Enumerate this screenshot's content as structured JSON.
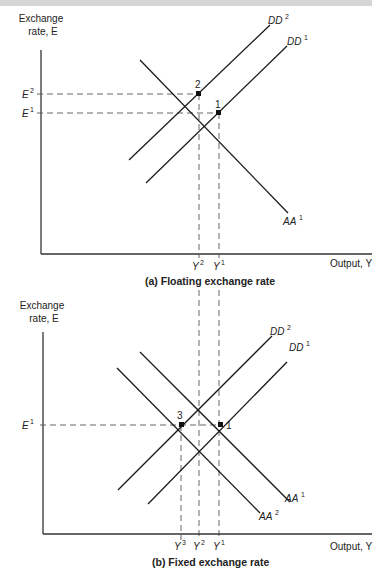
{
  "panels": [
    {
      "id": "a",
      "caption": "(a) Floating exchange rate",
      "y_axis_label_line1": "Exchange",
      "y_axis_label_line2": "rate, E",
      "x_axis_label": "Output, Y",
      "y_ticks": [
        {
          "label": "E",
          "sup": "2"
        },
        {
          "label": "E",
          "sup": "1"
        }
      ],
      "x_ticks": [
        {
          "label": "Y",
          "sup": "2"
        },
        {
          "label": "Y",
          "sup": "1"
        }
      ],
      "curves": [
        {
          "name": "DD",
          "sup": "2"
        },
        {
          "name": "DD",
          "sup": "1"
        },
        {
          "name": "AA",
          "sup": "1"
        }
      ],
      "points": [
        "2",
        "1"
      ]
    },
    {
      "id": "b",
      "caption": "(b) Fixed exchange rate",
      "y_axis_label_line1": "Exchange",
      "y_axis_label_line2": "rate, E",
      "x_axis_label": "Output, Y",
      "y_ticks": [
        {
          "label": "E",
          "sup": "1"
        }
      ],
      "x_ticks": [
        {
          "label": "Y",
          "sup": "3"
        },
        {
          "label": "Y",
          "sup": "2"
        },
        {
          "label": "Y",
          "sup": "1"
        }
      ],
      "curves": [
        {
          "name": "DD",
          "sup": "2"
        },
        {
          "name": "DD",
          "sup": "1"
        },
        {
          "name": "AA",
          "sup": "1"
        },
        {
          "name": "AA",
          "sup": "2"
        }
      ],
      "points": [
        "3",
        "1"
      ]
    }
  ]
}
